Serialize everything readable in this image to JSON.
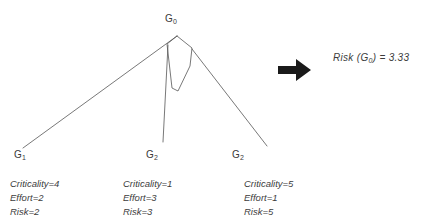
{
  "diagram": {
    "root": {
      "label_prefix": "G",
      "label_subscript": "0",
      "name": "G0"
    },
    "leaves": [
      {
        "label_prefix": "G",
        "label_subscript": "1",
        "criticality": "Criticality=4",
        "effort": "Effort=2",
        "risk": "Risk=2"
      },
      {
        "label_prefix": "G",
        "label_subscript": "2",
        "criticality": "Criticality=1",
        "effort": "Effort=3",
        "risk": "Risk=3"
      },
      {
        "label_prefix": "G",
        "label_subscript": "2",
        "criticality": "Criticality=5",
        "effort": "Effort=1",
        "risk": "Risk=5"
      }
    ],
    "edge_color": "#555555",
    "text_color": "#3c3c3c"
  },
  "arrow": {
    "icon": "right-arrow-icon",
    "color": "#1a1a1a"
  },
  "result": {
    "function_name": "Risk",
    "open_paren": "(",
    "argument_prefix": "G",
    "argument_subscript": "0",
    "close_paren": ")",
    "equals": "=",
    "value": "3.33"
  }
}
